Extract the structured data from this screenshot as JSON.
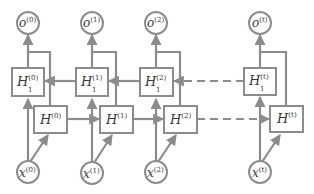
{
  "diagram": {
    "colors": {
      "stroke": "#8c8c8c",
      "node_fill": "#ffffff",
      "text": "#3a3a3a"
    },
    "columns": [
      {
        "index": "0",
        "output": "o",
        "output_sup": "(0)",
        "top_hidden": "H",
        "top_hidden_sub": "1",
        "top_hidden_sup": "(0)",
        "hidden": "H",
        "hidden_sup": "(0)",
        "input": "x",
        "input_sup": "(0)"
      },
      {
        "index": "1",
        "output": "o",
        "output_sup": "(1)",
        "top_hidden": "H",
        "top_hidden_sub": "1",
        "top_hidden_sup": "(1)",
        "hidden": "H",
        "hidden_sup": "(1)",
        "input": "x",
        "input_sup": "(1)"
      },
      {
        "index": "2",
        "output": "o",
        "output_sup": "(2)",
        "top_hidden": "H",
        "top_hidden_sub": "1",
        "top_hidden_sup": "(2)",
        "hidden": "H",
        "hidden_sup": "(2)",
        "input": "x",
        "input_sup": "(2)"
      },
      {
        "index": "t",
        "output": "o",
        "output_sup": "(t)",
        "top_hidden": "H",
        "top_hidden_sub": "1",
        "top_hidden_sup": "(t)",
        "hidden": "H",
        "hidden_sup": "(t)",
        "input": "x",
        "input_sup": "(t)"
      }
    ],
    "connections": {
      "forward_layer": "H(0) → H(1) → H(2) ⇢ H(t)",
      "backward_layer": "H1(t) ⇢ H1(2) → H1(1) → H1(0)"
    }
  }
}
